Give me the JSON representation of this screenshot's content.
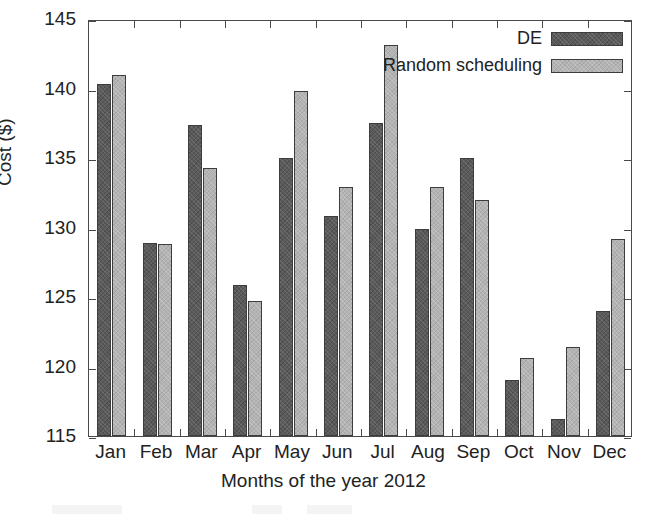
{
  "chart_data": {
    "type": "bar",
    "title": "",
    "xlabel": "Months of the year 2012",
    "ylabel": "Cost ($)",
    "ylim": [
      115,
      145
    ],
    "yticks": [
      115,
      120,
      125,
      130,
      135,
      140,
      145
    ],
    "ytick_labels": [
      "115",
      "120",
      "125",
      "130",
      "135",
      "140",
      "145"
    ],
    "grid": false,
    "legend_position": "top-right",
    "categories": [
      "Jan",
      "Feb",
      "Mar",
      "Apr",
      "May",
      "Jun",
      "Jul",
      "Aug",
      "Sep",
      "Oct",
      "Nov",
      "Dec"
    ],
    "series": [
      {
        "name": "DE",
        "color": "#5a5a5a",
        "values": [
          140.3,
          128.9,
          137.4,
          125.9,
          135.0,
          130.8,
          137.5,
          129.9,
          135.0,
          119.0,
          116.2,
          124.0
        ]
      },
      {
        "name": "Random scheduling",
        "color": "#b3b3b3",
        "values": [
          141.0,
          128.8,
          134.3,
          124.7,
          139.8,
          132.9,
          143.1,
          132.9,
          132.0,
          120.6,
          121.4,
          129.2
        ]
      }
    ]
  },
  "legend": {
    "entries": [
      {
        "label": "DE",
        "swatch": "de"
      },
      {
        "label": "Random scheduling",
        "swatch": "rand"
      }
    ]
  },
  "colors": {
    "series_de": "#5a5a5a",
    "series_random": "#b3b3b3",
    "axis": "#4a4a4a",
    "text": "#222222",
    "background": "#ffffff"
  }
}
